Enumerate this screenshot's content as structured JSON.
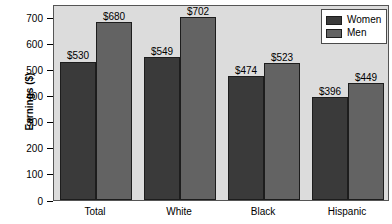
{
  "chart_data": {
    "type": "bar",
    "title": "",
    "xlabel": "",
    "ylabel": "Earnings ($)",
    "categories": [
      "Total",
      "White",
      "Black",
      "Hispanic"
    ],
    "series": [
      {
        "name": "Women",
        "color": "#3a3a3a",
        "values": [
          530,
          549,
          474,
          396
        ],
        "labels": [
          "$530",
          "$549",
          "$474",
          "$396"
        ]
      },
      {
        "name": "Men",
        "color": "#636363",
        "values": [
          680,
          702,
          523,
          449
        ],
        "labels": [
          "$680",
          "$702",
          "$523",
          "$449"
        ]
      }
    ],
    "ylim": [
      0,
      750
    ],
    "yticks": [
      0,
      100,
      200,
      300,
      400,
      500,
      600,
      700
    ],
    "ytick_labels": [
      "0",
      "100",
      "200",
      "300",
      "400",
      "500",
      "600",
      "700"
    ],
    "grid": false,
    "legend_position": "top-right",
    "plot_background": "#dcdcdc",
    "page_background": "#ffffff"
  },
  "legend": {
    "items": [
      {
        "label": "Women"
      },
      {
        "label": "Men"
      }
    ]
  }
}
